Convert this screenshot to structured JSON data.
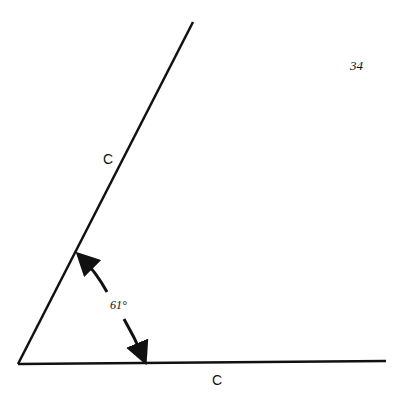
{
  "page_number": "34",
  "diagram": {
    "type": "angle",
    "vertex": [
      18,
      364
    ],
    "sides": [
      {
        "name": "slanted-side",
        "label": "C",
        "end": [
          193,
          22
        ]
      },
      {
        "name": "base-side",
        "label": "C",
        "end": [
          386,
          361
        ]
      }
    ],
    "angle_label": "61°",
    "stroke_color": "#111111"
  }
}
